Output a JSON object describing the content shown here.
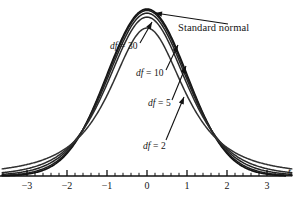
{
  "chart_data": {
    "type": "line",
    "title": "",
    "subtitle": "",
    "xlabel": "t",
    "ylabel": "",
    "xlim": [
      -3.7,
      3.7
    ],
    "ylim": [
      0,
      0.4
    ],
    "grid": false,
    "legend_position": "inline-annotations",
    "x_ticks_major": [
      -3,
      -2,
      -1,
      0,
      1,
      2,
      3
    ],
    "x_tick_labels": [
      "−3",
      "−2",
      "−1",
      "0",
      "1",
      "2",
      "3"
    ],
    "x_tick_minor_step": 0.2,
    "series": [
      {
        "name": "Standard normal",
        "label": "Standard normal",
        "distribution": "normal",
        "df": null,
        "peak_density": 0.3989,
        "color": "#111111",
        "line_width": 1.7
      },
      {
        "name": "df = 30",
        "label": "df = 30",
        "distribution": "t",
        "df": 30,
        "peak_density": 0.3956,
        "color": "#1d1d1d",
        "line_width": 1.5
      },
      {
        "name": "df = 10",
        "label": "df = 10",
        "distribution": "t",
        "df": 10,
        "peak_density": 0.3891,
        "color": "#242424",
        "line_width": 1.5
      },
      {
        "name": "df = 5",
        "label": "df = 5",
        "distribution": "t",
        "df": 5,
        "peak_density": 0.3796,
        "color": "#2b2b2b",
        "line_width": 1.5
      },
      {
        "name": "df = 2",
        "label": "df = 2",
        "distribution": "t",
        "df": 2,
        "peak_density": 0.3536,
        "color": "#323232",
        "line_width": 1.5
      }
    ],
    "annotations": [
      {
        "text": "Standard normal",
        "target_series": "Standard normal"
      },
      {
        "text": "df = 30",
        "target_series": "df = 30"
      },
      {
        "text": "df = 10",
        "target_series": "df = 10"
      },
      {
        "text": "df = 5",
        "target_series": "df = 5"
      },
      {
        "text": "df = 2",
        "target_series": "df = 2"
      }
    ]
  },
  "annotations": {
    "standard_normal": "Standard normal",
    "df30_prefix": "df",
    "df30_rest": " = 30",
    "df10_prefix": "df",
    "df10_rest": " = 10",
    "df5_prefix": "df",
    "df5_rest": " = 5",
    "df2_prefix": "df",
    "df2_rest": " = 2"
  },
  "axis": {
    "name": "t",
    "tick_labels": [
      "−3",
      "−2",
      "−1",
      "0",
      "1",
      "2",
      "3"
    ]
  },
  "colors": {
    "curve": "#111111",
    "axis": "#111111",
    "text": "#141414",
    "background": "#ffffff"
  }
}
